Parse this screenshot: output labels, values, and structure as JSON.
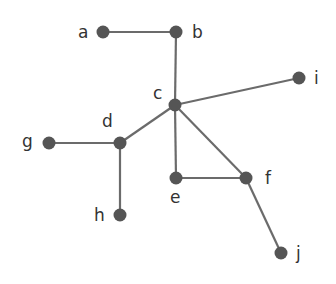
{
  "diagram": {
    "type": "undirected-graph",
    "nodes": [
      {
        "id": "a",
        "label": "a",
        "x": 103,
        "y": 32,
        "lx": 78,
        "ly": 38
      },
      {
        "id": "b",
        "label": "b",
        "x": 176,
        "y": 32,
        "lx": 192,
        "ly": 38
      },
      {
        "id": "c",
        "label": "c",
        "x": 175,
        "y": 105,
        "lx": 153,
        "ly": 99
      },
      {
        "id": "d",
        "label": "d",
        "x": 120,
        "y": 143,
        "lx": 102,
        "ly": 127
      },
      {
        "id": "e",
        "label": "e",
        "x": 176,
        "y": 178,
        "lx": 170,
        "ly": 203
      },
      {
        "id": "f",
        "label": "f",
        "x": 246,
        "y": 178,
        "lx": 265,
        "ly": 184
      },
      {
        "id": "g",
        "label": "g",
        "x": 49,
        "y": 143,
        "lx": 22,
        "ly": 147
      },
      {
        "id": "h",
        "label": "h",
        "x": 120,
        "y": 215,
        "lx": 94,
        "ly": 221
      },
      {
        "id": "i",
        "label": "i",
        "x": 299,
        "y": 78,
        "lx": 314,
        "ly": 84
      },
      {
        "id": "j",
        "label": "j",
        "x": 281,
        "y": 253,
        "lx": 296,
        "ly": 259
      }
    ],
    "edges": [
      [
        "a",
        "b"
      ],
      [
        "b",
        "c"
      ],
      [
        "c",
        "i"
      ],
      [
        "c",
        "d"
      ],
      [
        "c",
        "e"
      ],
      [
        "c",
        "f"
      ],
      [
        "d",
        "g"
      ],
      [
        "d",
        "h"
      ],
      [
        "e",
        "f"
      ],
      [
        "f",
        "j"
      ]
    ],
    "colors": {
      "node": "#555555",
      "edge": "#6b6b6b",
      "label": "#333333",
      "background": "#ffffff"
    }
  }
}
